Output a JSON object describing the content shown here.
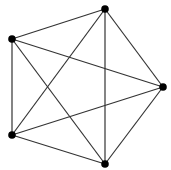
{
  "diagram": {
    "type": "complete-graph",
    "name": "K5",
    "colors": {
      "edge": "#333333",
      "node": "#000000",
      "background": "#ffffff"
    },
    "nodes": [
      {
        "id": "v1",
        "x": 105,
        "y": 9
      },
      {
        "id": "v2",
        "x": 12,
        "y": 39
      },
      {
        "id": "v3",
        "x": 163,
        "y": 87
      },
      {
        "id": "v4",
        "x": 12,
        "y": 135
      },
      {
        "id": "v5",
        "x": 105,
        "y": 164
      }
    ],
    "edges": [
      [
        "v1",
        "v2"
      ],
      [
        "v1",
        "v3"
      ],
      [
        "v1",
        "v4"
      ],
      [
        "v1",
        "v5"
      ],
      [
        "v2",
        "v3"
      ],
      [
        "v2",
        "v4"
      ],
      [
        "v2",
        "v5"
      ],
      [
        "v3",
        "v4"
      ],
      [
        "v3",
        "v5"
      ],
      [
        "v4",
        "v5"
      ]
    ]
  }
}
